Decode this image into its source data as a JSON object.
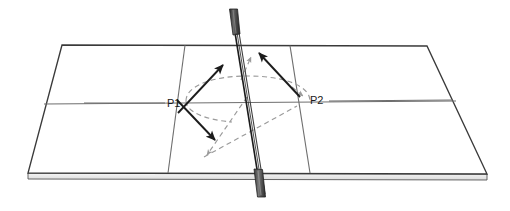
{
  "figure": {
    "type": "technical-line-diagram",
    "background_color": "#ffffff",
    "width": 510,
    "height": 211
  },
  "labels": {
    "p1": "P1",
    "p2": "P2"
  },
  "colors": {
    "outline": "#3a3a3a",
    "inner_line": "#6e6e6e",
    "edge_band_fill": "#e9e9e9",
    "edge_band_top": "#f4f4f4",
    "solid_arrow": "#1c1c1c",
    "dashed_arrow": "#9a9a9a",
    "pole_dark": "#3d3d3d",
    "pole_grip": "#555555",
    "label_text": "#1a1a1a"
  },
  "table": {
    "name": "table-tennis-table",
    "top_surface_corners": [
      [
        62,
        45
      ],
      [
        427,
        46
      ],
      [
        487,
        174
      ],
      [
        28,
        173
      ]
    ],
    "edge_band_height": 6,
    "center_line_horizontal": {
      "from": [
        44,
        104
      ],
      "to": [
        456,
        101
      ]
    },
    "service_line_left": {
      "from": [
        185,
        45
      ],
      "to": [
        168,
        173
      ]
    },
    "service_line_right": {
      "from": [
        290,
        46
      ],
      "to": [
        310,
        173
      ]
    }
  },
  "pole": {
    "name": "vertical-pole",
    "top_point": [
      233,
      10
    ],
    "bottom_point": [
      262,
      196
    ],
    "top_grip": {
      "x": 229,
      "y": 8,
      "w": 8,
      "h": 26
    },
    "bottom_grip": {
      "x": 255,
      "y": 170,
      "w": 9,
      "h": 28
    }
  },
  "arrows": {
    "solid": [
      {
        "name": "arrow-p1-up-right",
        "from": [
          178,
          113
        ],
        "to": [
          224,
          64
        ],
        "style": "solid",
        "color": "#1c1c1c"
      },
      {
        "name": "arrow-p1-down-right",
        "from": [
          177,
          100
        ],
        "to": [
          216,
          141
        ],
        "style": "solid",
        "color": "#1c1c1c"
      },
      {
        "name": "arrow-p2-up-left",
        "from": [
          300,
          97
        ],
        "to": [
          258,
          52
        ],
        "style": "solid",
        "color": "#1c1c1c"
      }
    ],
    "dashed": [
      {
        "name": "dashed-arc-trajectory",
        "type": "ellipse-arc",
        "center": [
          248,
          101
        ],
        "rx": 62,
        "ry": 22,
        "style": "dashed",
        "color": "#9a9a9a"
      },
      {
        "name": "dashed-arrow-to-lower-left",
        "from": [
          247,
          99
        ],
        "to": [
          206,
          156
        ],
        "style": "dashed",
        "color": "#9a9a9a"
      },
      {
        "name": "dashed-arrow-lower-left-to-p2",
        "from": [
          204,
          157
        ],
        "to": [
          296,
          106
        ],
        "style": "dashed",
        "color": "#9a9a9a"
      },
      {
        "name": "dashed-arrow-short-up",
        "from": [
          243,
          78
        ],
        "to": [
          251,
          58
        ],
        "style": "dashed",
        "color": "#9a9a9a"
      },
      {
        "name": "dashed-arrow-arc-head-right",
        "from": [
          292,
          88
        ],
        "to": [
          303,
          96
        ],
        "style": "dashed",
        "color": "#9a9a9a"
      }
    ]
  },
  "leader_lines": [
    {
      "name": "leader-line-p1",
      "from": [
        84,
        103
      ],
      "to": [
        165,
        103
      ]
    },
    {
      "name": "leader-line-p2",
      "from": [
        328,
        101
      ],
      "to": [
        452,
        100
      ]
    }
  ]
}
